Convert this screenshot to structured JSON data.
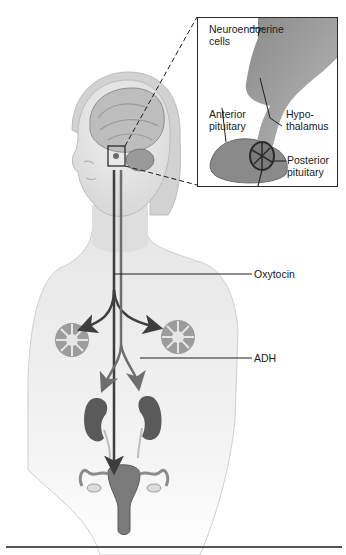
{
  "figure": {
    "type": "anatomical diagram",
    "colors": {
      "skin": "#e4e4e4",
      "skin_shadow": "#c8c8c8",
      "brain": "#bdbdbd",
      "hormone_path_dark": "#3d3d3d",
      "hormone_path_light": "#6e6e6e",
      "organ": "#5a5a5a",
      "gland": "#8c8c8c",
      "inset_bg_dark": "#9a9a9a",
      "rule": "#555555"
    }
  },
  "inset": {
    "labels": {
      "neuroendocrine": "Neuroendocrine",
      "cells": "cells",
      "anterior": "Anterior",
      "anterior_2": "pituitary",
      "hypo": "Hypo-",
      "thalamus": "thalamus",
      "posterior": "Posterior",
      "posterior_2": "pituitary"
    }
  },
  "callouts": {
    "oxytocin": "Oxytocin",
    "adh": "ADH"
  },
  "targets": [
    "mammary glands",
    "kidneys",
    "uterus"
  ]
}
